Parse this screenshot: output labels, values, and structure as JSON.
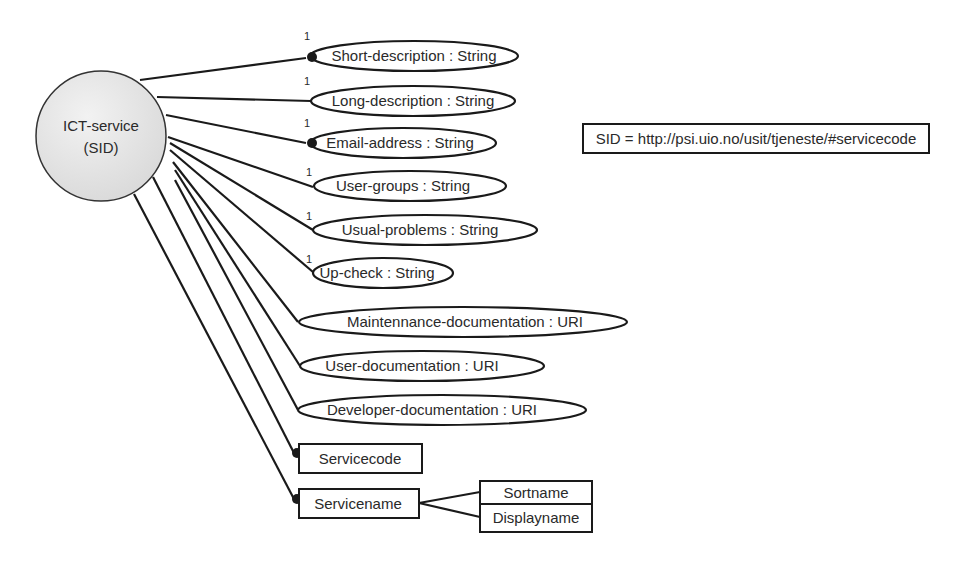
{
  "diagram": {
    "entity": {
      "line1": "ICT-service",
      "line2": "(SID)",
      "cx": 101,
      "cy": 136,
      "r": 65,
      "fill": "#e6e6e6"
    },
    "note": {
      "text": "SID = http://psi.uio.no/usit/tjeneste/#servicecode"
    },
    "attributes": [
      {
        "label": "Short-description : String",
        "cardinality": "1",
        "required": true
      },
      {
        "label": "Long-description : String",
        "cardinality": "1",
        "required": false
      },
      {
        "label": "Email-address : String",
        "cardinality": "1",
        "required": true
      },
      {
        "label": "User-groups : String",
        "cardinality": "1",
        "required": false
      },
      {
        "label": "Usual-problems : String",
        "cardinality": "1",
        "required": false
      },
      {
        "label": "Up-check : String",
        "cardinality": "1",
        "required": false
      },
      {
        "label": "Maintennance-documentation : URI",
        "cardinality": "",
        "required": false
      },
      {
        "label": "User-documentation : URI",
        "cardinality": "",
        "required": false
      },
      {
        "label": "Developer-documentation : URI",
        "cardinality": "",
        "required": false
      }
    ],
    "identifiers": [
      {
        "label": "Servicecode",
        "required": true
      },
      {
        "label": "Servicename",
        "required": true
      }
    ],
    "name_variants": [
      {
        "label": "Sortname"
      },
      {
        "label": "Displayname"
      }
    ]
  }
}
